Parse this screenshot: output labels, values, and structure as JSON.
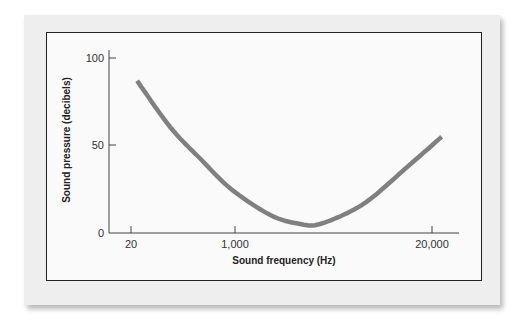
{
  "chart_data": {
    "type": "line",
    "title": "",
    "xlabel": "Sound frequency (Hz)",
    "ylabel": "Sound pressure (decibels)",
    "xscale": "log",
    "x_ticks": [
      "20",
      "1,000",
      "20,000"
    ],
    "y_ticks": [
      "0",
      "50",
      "100"
    ],
    "ylim": [
      0,
      100
    ],
    "grid": false,
    "legend": null,
    "series": [
      {
        "name": "Hearing threshold",
        "color": "#808080",
        "x": [
          23,
          50,
          100,
          200,
          500,
          1000,
          1500,
          3000,
          5000,
          10000,
          25000
        ],
        "y": [
          87,
          60,
          42,
          25,
          10,
          5,
          5,
          12,
          20,
          35,
          55
        ]
      }
    ]
  },
  "labels": {
    "xlabel": "Sound frequency (Hz)",
    "ylabel": "Sound pressure (decibels)",
    "y100": "100",
    "y50": "50",
    "y0": "0",
    "x20": "20",
    "x1000": "1,000",
    "x20000": "20,000"
  }
}
